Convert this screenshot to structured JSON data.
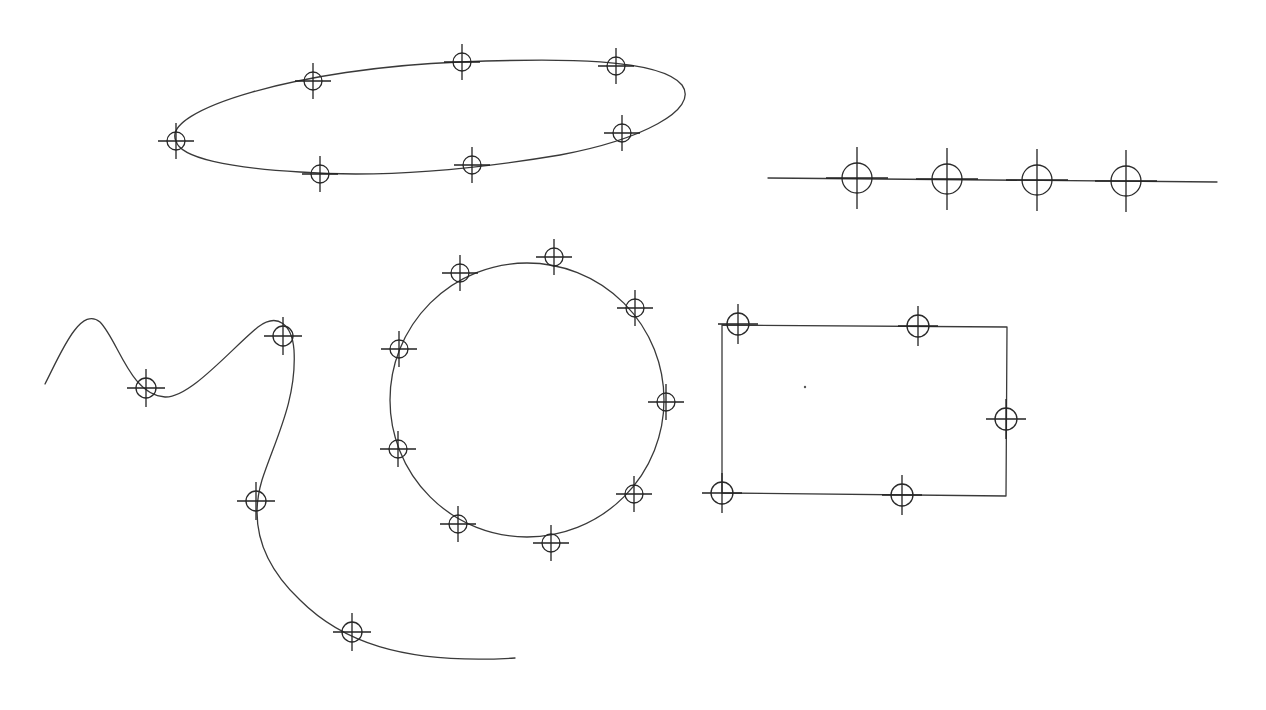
{
  "canvas": {
    "width": 1266,
    "height": 710,
    "background": "#ffffff",
    "stroke": "#3a3a3a"
  },
  "shapes": [
    {
      "id": "ellipse",
      "type": "ellipse",
      "path": "M 176 141 C 160 110, 300 68, 460 62 C 560 58, 660 58, 682 85 C 700 110, 640 140, 560 155 C 470 170, 380 178, 300 172 C 230 168, 180 158, 176 141 Z",
      "marker_radius": 9,
      "cross_len": 18,
      "markers": [
        [
          176,
          141
        ],
        [
          313,
          81
        ],
        [
          462,
          62
        ],
        [
          616,
          66
        ],
        [
          622,
          133
        ],
        [
          472,
          165
        ],
        [
          320,
          174
        ]
      ]
    },
    {
      "id": "line",
      "type": "polyline",
      "path": "M 768 178 L 1217 182",
      "marker_radius": 15,
      "cross_len": 31,
      "markers": [
        [
          857,
          178
        ],
        [
          947,
          179
        ],
        [
          1037,
          180
        ],
        [
          1126,
          181
        ]
      ]
    },
    {
      "id": "curve",
      "type": "freeform",
      "path": "M 45 384 C 60 355, 80 305, 100 322 C 118 340, 130 395, 165 397 C 190 398, 230 350, 258 327 C 278 312, 292 325, 294 350 C 297 400, 275 440, 262 480 C 250 520, 258 560, 300 600 C 340 640, 400 665, 515 658",
      "marker_radius": 10,
      "cross_len": 19,
      "markers": [
        [
          146,
          388
        ],
        [
          283,
          336
        ],
        [
          256,
          501
        ],
        [
          352,
          632
        ]
      ]
    },
    {
      "id": "circle",
      "type": "circle",
      "cx": 527,
      "cy": 400,
      "r": 137,
      "marker_radius": 9,
      "cross_len": 18,
      "markers": [
        [
          554,
          257
        ],
        [
          635,
          308
        ],
        [
          666,
          402
        ],
        [
          634,
          494
        ],
        [
          551,
          543
        ],
        [
          458,
          524
        ],
        [
          398,
          449
        ],
        [
          399,
          349
        ],
        [
          460,
          273
        ]
      ]
    },
    {
      "id": "rectangle",
      "type": "polyline",
      "path": "M 722 325 L 1007 327 L 1006 496 L 722 493 L 722 325",
      "marker_radius": 11,
      "cross_len": 20,
      "markers": [
        [
          738,
          324
        ],
        [
          918,
          326
        ],
        [
          1006,
          419
        ],
        [
          722,
          493
        ],
        [
          902,
          495
        ]
      ]
    }
  ],
  "dots": [
    [
      805,
      387
    ]
  ]
}
